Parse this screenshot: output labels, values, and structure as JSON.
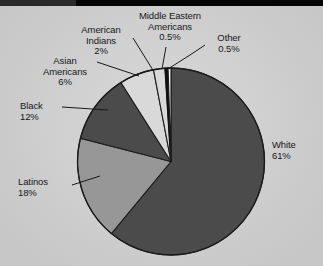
{
  "figure": {
    "background_color": "#d2d2d2",
    "has_scan_artifact_band": true
  },
  "chart_data": {
    "type": "pie",
    "title": "",
    "subtitle": "",
    "xlabel": "",
    "ylabel": "",
    "legend_position": "callout-labels",
    "grid": false,
    "start_angle_deg": 0,
    "direction": "clockwise",
    "categories": [
      "White",
      "Latinos",
      "Black",
      "Asian Americans",
      "American Indians",
      "Middle Eastern Americans",
      "Other"
    ],
    "values": [
      61,
      18,
      12,
      6,
      2,
      0.5,
      0.5
    ],
    "value_labels": [
      "61%",
      "18%",
      "12%",
      "6%",
      "2%",
      "0.5%",
      "0.5%"
    ],
    "colors": [
      "#4b4b4b",
      "#979797",
      "#4b4b4b",
      "#d9d9d9",
      "#d9d9d9",
      "#111111",
      "#f2f2f2"
    ],
    "slices": [
      {
        "label": "White",
        "percent": 61,
        "percent_label": "61%",
        "color": "#4b4b4b"
      },
      {
        "label": "Latinos",
        "percent": 18,
        "percent_label": "18%",
        "color": "#979797"
      },
      {
        "label": "Black",
        "percent": 12,
        "percent_label": "12%",
        "color": "#4b4b4b"
      },
      {
        "label": "Asian Americans",
        "percent": 6,
        "percent_label": "6%",
        "color": "#d9d9d9"
      },
      {
        "label": "American Indians",
        "percent": 2,
        "percent_label": "2%",
        "color": "#d9d9d9"
      },
      {
        "label": "Middle Eastern Americans",
        "percent": 0.5,
        "percent_label": "0.5%",
        "color": "#111111"
      },
      {
        "label": "Other",
        "percent": 0.5,
        "percent_label": "0.5%",
        "color": "#f2f2f2"
      }
    ]
  },
  "labels": {
    "white": {
      "name": "White",
      "pct": "61%"
    },
    "latinos": {
      "name": "Latinos",
      "pct": "18%"
    },
    "black": {
      "name": "Black",
      "pct": "12%"
    },
    "asian_americans": {
      "name_line1": "Asian",
      "name_line2": "Americans",
      "pct": "6%"
    },
    "american_indians": {
      "name_line1": "American",
      "name_line2": "Indians",
      "pct": "2%"
    },
    "middle_eastern": {
      "name_line1": "Middle Eastern",
      "name_line2": "Americans",
      "pct": "0.5%"
    },
    "other": {
      "name": "Other",
      "pct": "0.5%"
    }
  }
}
